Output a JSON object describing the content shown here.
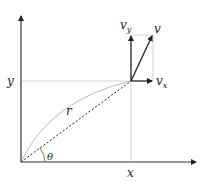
{
  "diagram": {
    "labels": {
      "y_axis_value": "y",
      "x_axis_value": "x",
      "radius": "r",
      "angle": "θ",
      "velocity": "v",
      "vy_base": "v",
      "vy_sub": "y",
      "vx_base": "v",
      "vx_sub": "x"
    },
    "colors": {
      "axis": "#333333",
      "guide": "#bbbbbb",
      "vector": "#222222",
      "path": "#999999"
    }
  }
}
